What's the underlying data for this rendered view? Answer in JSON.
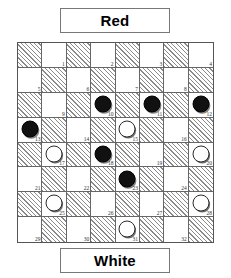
{
  "top_player": {
    "label": "Red"
  },
  "bottom_player": {
    "label": "White"
  },
  "board": {
    "rows": 8,
    "cols": 8,
    "playable_square_count": 32,
    "light_square_color": "#ffffff",
    "dark_square_color": "#8a8a8a",
    "border_color": "#555555",
    "black_piece_color": "#111111",
    "white_piece_color": "#ffffff"
  },
  "squares": [
    {
      "number": 1,
      "row": 0,
      "col": 1,
      "piece": ""
    },
    {
      "number": 2,
      "row": 0,
      "col": 3,
      "piece": ""
    },
    {
      "number": 3,
      "row": 0,
      "col": 5,
      "piece": ""
    },
    {
      "number": 4,
      "row": 0,
      "col": 7,
      "piece": ""
    },
    {
      "number": 5,
      "row": 1,
      "col": 0,
      "piece": ""
    },
    {
      "number": 6,
      "row": 1,
      "col": 2,
      "piece": ""
    },
    {
      "number": 7,
      "row": 1,
      "col": 4,
      "piece": ""
    },
    {
      "number": 8,
      "row": 1,
      "col": 6,
      "piece": ""
    },
    {
      "number": 9,
      "row": 2,
      "col": 1,
      "piece": ""
    },
    {
      "number": 10,
      "row": 2,
      "col": 3,
      "piece": "black"
    },
    {
      "number": 11,
      "row": 2,
      "col": 5,
      "piece": "black"
    },
    {
      "number": 12,
      "row": 2,
      "col": 7,
      "piece": "black"
    },
    {
      "number": 13,
      "row": 3,
      "col": 0,
      "piece": "black"
    },
    {
      "number": 14,
      "row": 3,
      "col": 2,
      "piece": ""
    },
    {
      "number": 15,
      "row": 3,
      "col": 4,
      "piece": "white"
    },
    {
      "number": 16,
      "row": 3,
      "col": 6,
      "piece": ""
    },
    {
      "number": 17,
      "row": 4,
      "col": 1,
      "piece": "white"
    },
    {
      "number": 18,
      "row": 4,
      "col": 3,
      "piece": "black"
    },
    {
      "number": 19,
      "row": 4,
      "col": 5,
      "piece": ""
    },
    {
      "number": 20,
      "row": 4,
      "col": 7,
      "piece": "white"
    },
    {
      "number": 21,
      "row": 5,
      "col": 0,
      "piece": ""
    },
    {
      "number": 22,
      "row": 5,
      "col": 2,
      "piece": ""
    },
    {
      "number": 23,
      "row": 5,
      "col": 4,
      "piece": "black"
    },
    {
      "number": 24,
      "row": 5,
      "col": 6,
      "piece": ""
    },
    {
      "number": 25,
      "row": 6,
      "col": 1,
      "piece": "white"
    },
    {
      "number": 26,
      "row": 6,
      "col": 3,
      "piece": ""
    },
    {
      "number": 27,
      "row": 6,
      "col": 5,
      "piece": ""
    },
    {
      "number": 28,
      "row": 6,
      "col": 7,
      "piece": "white"
    },
    {
      "number": 29,
      "row": 7,
      "col": 0,
      "piece": ""
    },
    {
      "number": 30,
      "row": 7,
      "col": 2,
      "piece": ""
    },
    {
      "number": 31,
      "row": 7,
      "col": 4,
      "piece": "white"
    },
    {
      "number": 32,
      "row": 7,
      "col": 6,
      "piece": ""
    }
  ]
}
